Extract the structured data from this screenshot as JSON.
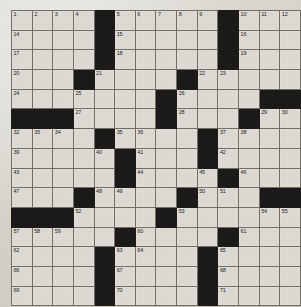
{
  "puzzle": {
    "title": "Crossword Grid",
    "columns": 14,
    "rows": 15,
    "colors": {
      "paper": "#d8d6cf",
      "cell": "#dcdad2",
      "block": "#1b1a18",
      "gridline": "#6f6d66",
      "number": "#24231f"
    },
    "grid": [
      [
        {
          "n": "1"
        },
        {
          "n": "2"
        },
        {
          "n": "3"
        },
        {
          "n": "4"
        },
        {
          "b": true
        },
        {
          "n": "5"
        },
        {
          "n": "6"
        },
        {
          "n": "7"
        },
        {
          "n": "8"
        },
        {
          "n": "9"
        },
        {
          "b": true
        },
        {
          "n": "10"
        },
        {
          "n": "11"
        },
        {
          "n": "12"
        }
      ],
      [
        {
          "n": "14"
        },
        {},
        {},
        {},
        {
          "b": true
        },
        {
          "n": "15"
        },
        {},
        {},
        {},
        {},
        {
          "b": true
        },
        {
          "n": "16"
        },
        {},
        {}
      ],
      [
        {
          "n": "17"
        },
        {},
        {},
        {},
        {
          "b": true
        },
        {
          "n": "18"
        },
        {},
        {},
        {},
        {},
        {
          "b": true
        },
        {
          "n": "19"
        },
        {},
        {}
      ],
      [
        {
          "n": "20"
        },
        {},
        {},
        {
          "b": true
        },
        {
          "n": "21"
        },
        {},
        {},
        {},
        {
          "b": true
        },
        {
          "n": "22"
        },
        {
          "n": "23"
        },
        {},
        {},
        {}
      ],
      [
        {
          "n": "24"
        },
        {},
        {},
        {
          "n": "25"
        },
        {},
        {},
        {},
        {
          "b": true
        },
        {
          "n": "26"
        },
        {},
        {},
        {},
        {
          "b": true
        },
        {
          "b": true
        }
      ],
      [
        {
          "b": true
        },
        {
          "b": true
        },
        {
          "b": true
        },
        {
          "n": "27"
        },
        {},
        {},
        {},
        {
          "b": true
        },
        {
          "n": "28"
        },
        {},
        {},
        {
          "b": true
        },
        {
          "n": "29"
        },
        {
          "n": "30"
        }
      ],
      [
        {
          "n": "32"
        },
        {
          "n": "33"
        },
        {
          "n": "34"
        },
        {},
        {
          "b": true
        },
        {
          "n": "35"
        },
        {
          "n": "36"
        },
        {},
        {},
        {
          "b": true
        },
        {
          "n": "37"
        },
        {
          "n": "38"
        },
        {},
        {}
      ],
      [
        {
          "n": "39"
        },
        {},
        {},
        {},
        {
          "n": "40"
        },
        {
          "b": true
        },
        {
          "n": "41"
        },
        {},
        {},
        {
          "b": true
        },
        {
          "n": "42"
        },
        {},
        {},
        {}
      ],
      [
        {
          "n": "43"
        },
        {},
        {},
        {},
        {},
        {
          "b": true
        },
        {
          "n": "44"
        },
        {},
        {},
        {
          "n": "45"
        },
        {
          "b": true
        },
        {
          "n": "46"
        },
        {},
        {}
      ],
      [
        {
          "n": "47"
        },
        {},
        {},
        {
          "b": true
        },
        {
          "n": "48"
        },
        {
          "n": "49"
        },
        {},
        {},
        {
          "b": true
        },
        {
          "n": "50"
        },
        {
          "n": "51"
        },
        {},
        {
          "b": true
        },
        {
          "b": true
        }
      ],
      [
        {
          "b": true
        },
        {
          "b": true
        },
        {
          "b": true
        },
        {
          "n": "52"
        },
        {},
        {},
        {},
        {
          "b": true
        },
        {
          "n": "53"
        },
        {},
        {},
        {},
        {
          "n": "54"
        },
        {
          "n": "55"
        }
      ],
      [
        {
          "n": "57"
        },
        {
          "n": "58"
        },
        {
          "n": "59"
        },
        {},
        {},
        {
          "b": true
        },
        {
          "n": "60"
        },
        {},
        {},
        {},
        {
          "b": true
        },
        {
          "n": "61"
        },
        {},
        {}
      ],
      [
        {
          "n": "62"
        },
        {},
        {},
        {},
        {
          "b": true
        },
        {
          "n": "63"
        },
        {
          "n": "64"
        },
        {},
        {},
        {
          "b": true
        },
        {
          "n": "65"
        },
        {},
        {},
        {}
      ],
      [
        {
          "n": "66"
        },
        {},
        {},
        {},
        {
          "b": true
        },
        {
          "n": "67"
        },
        {},
        {},
        {},
        {
          "b": true
        },
        {
          "n": "68"
        },
        {},
        {},
        {}
      ],
      [
        {
          "n": "69"
        },
        {},
        {},
        {},
        {
          "b": true
        },
        {
          "n": "70"
        },
        {},
        {},
        {},
        {
          "b": true
        },
        {
          "n": "71"
        },
        {},
        {},
        {}
      ]
    ],
    "extra_numbers": {
      "row4_col13": "13",
      "row5_col13": "31",
      "row10_col13": "56"
    }
  }
}
